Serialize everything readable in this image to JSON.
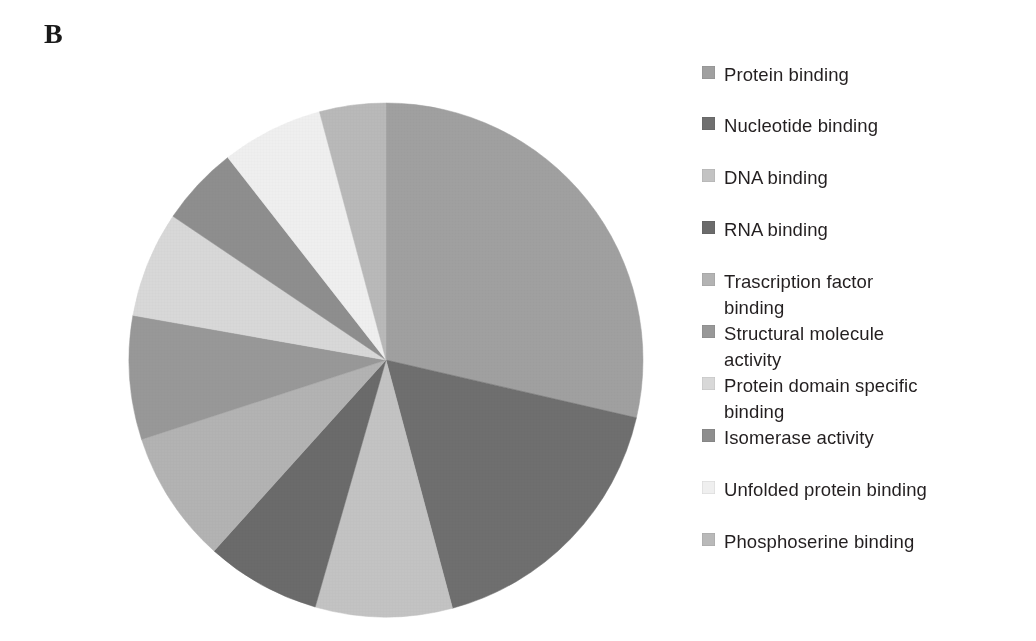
{
  "panel": {
    "label": "B"
  },
  "chart_data": {
    "type": "pie",
    "title": "",
    "subtitle": "",
    "xlabel": "",
    "ylabel": "",
    "legend_position": "right",
    "grid": false,
    "start_angle_deg": 0,
    "direction": "clockwise",
    "categories": [
      "Protein binding",
      "Nucleotide binding",
      "DNA binding",
      "RNA binding",
      "Trascription factor binding",
      "Structural molecule activity",
      "Protein domain specific binding",
      "Isomerase activity",
      "Unfolded protein binding",
      "Phosphoserine binding"
    ],
    "values": [
      28.6,
      17.2,
      8.6,
      7.2,
      8.3,
      7.8,
      6.7,
      5.0,
      6.4,
      4.2
    ],
    "unit": "percent",
    "colors": [
      "#a0a0a0",
      "#6f6f6f",
      "#c3c3c3",
      "#6b6b6b",
      "#b3b3b3",
      "#989898",
      "#d8d8d8",
      "#8e8e8e",
      "#efefef",
      "#b9b9b9"
    ],
    "slices": [
      {
        "label": "Protein binding",
        "value": 28.6,
        "start_deg": 0,
        "end_deg": 103,
        "color": "#a0a0a0"
      },
      {
        "label": "Nucleotide binding",
        "value": 17.2,
        "start_deg": 103,
        "end_deg": 165,
        "color": "#6f6f6f"
      },
      {
        "label": "DNA binding",
        "value": 8.6,
        "start_deg": 165,
        "end_deg": 196,
        "color": "#c3c3c3"
      },
      {
        "label": "RNA binding",
        "value": 7.2,
        "start_deg": 196,
        "end_deg": 222,
        "color": "#6b6b6b"
      },
      {
        "label": "Trascription factor binding",
        "value": 8.3,
        "start_deg": 222,
        "end_deg": 252,
        "color": "#b3b3b3"
      },
      {
        "label": "Structural molecule activity",
        "value": 7.8,
        "start_deg": 252,
        "end_deg": 280,
        "color": "#989898"
      },
      {
        "label": "Protein domain specific binding",
        "value": 6.7,
        "start_deg": 280,
        "end_deg": 304,
        "color": "#d8d8d8"
      },
      {
        "label": "Isomerase activity",
        "value": 5.0,
        "start_deg": 304,
        "end_deg": 322,
        "color": "#8e8e8e"
      },
      {
        "label": "Unfolded protein binding",
        "value": 6.4,
        "start_deg": 322,
        "end_deg": 345,
        "color": "#efefef"
      },
      {
        "label": "Phosphoserine binding",
        "value": 4.2,
        "start_deg": 345,
        "end_deg": 360,
        "color": "#b9b9b9"
      }
    ]
  },
  "legend": {
    "items": [
      {
        "label": "Protein binding",
        "color": "#a0a0a0",
        "top": 0,
        "swatch": "legend-swatch-square"
      },
      {
        "label": "Nucleotide binding",
        "color": "#6f6f6f",
        "top": 51,
        "swatch": "legend-swatch-square"
      },
      {
        "label": "DNA binding",
        "color": "#c3c3c3",
        "top": 103,
        "swatch": "legend-swatch-square"
      },
      {
        "label": "RNA binding",
        "color": "#6b6b6b",
        "top": 155,
        "swatch": "legend-swatch-square"
      },
      {
        "label": "Trascription factor\nbinding",
        "color": "#b3b3b3",
        "top": 207,
        "swatch": "legend-swatch-square"
      },
      {
        "label": "Structural molecule\nactivity",
        "color": "#989898",
        "top": 259,
        "swatch": "legend-swatch-square"
      },
      {
        "label": "Protein domain specific\nbinding",
        "color": "#d8d8d8",
        "top": 311,
        "swatch": "legend-swatch-square"
      },
      {
        "label": "Isomerase activity",
        "color": "#8e8e8e",
        "top": 363,
        "swatch": "legend-swatch-square"
      },
      {
        "label": "Unfolded protein binding",
        "color": "#efefef",
        "top": 415,
        "swatch": "legend-swatch-square"
      },
      {
        "label": "Phosphoserine binding",
        "color": "#b9b9b9",
        "top": 467,
        "swatch": "legend-swatch-square"
      }
    ]
  }
}
